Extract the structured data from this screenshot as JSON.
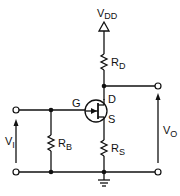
{
  "diagram": {
    "type": "circuit-schematic",
    "colors": {
      "ink": "#111111",
      "background": "#ffffff"
    },
    "labels": {
      "supply": {
        "main": "V",
        "sub": "DD"
      },
      "drain_resistor": {
        "main": "R",
        "sub": "D"
      },
      "bias_resistor": {
        "main": "R",
        "sub": "B"
      },
      "source_resistor": {
        "main": "R",
        "sub": "S"
      },
      "gate": "G",
      "drain": "D",
      "source": "S",
      "input_voltage": {
        "main": "V",
        "sub": "I"
      },
      "output_voltage": {
        "main": "V",
        "sub": "O"
      }
    },
    "components": [
      {
        "id": "VDD",
        "kind": "supply-arrow"
      },
      {
        "id": "RD",
        "kind": "resistor",
        "between": [
          "VDD",
          "drain"
        ]
      },
      {
        "id": "Q1",
        "kind": "n-channel-jfet",
        "pins": [
          "G",
          "D",
          "S"
        ]
      },
      {
        "id": "RS",
        "kind": "resistor",
        "between": [
          "source",
          "ground"
        ]
      },
      {
        "id": "RB",
        "kind": "resistor",
        "between": [
          "gate",
          "ground"
        ]
      },
      {
        "id": "GND",
        "kind": "ground"
      }
    ],
    "terminals": [
      {
        "id": "vi-top",
        "role": "input +"
      },
      {
        "id": "vi-bottom",
        "role": "input -"
      },
      {
        "id": "vo-top",
        "role": "output +"
      },
      {
        "id": "vo-bottom",
        "role": "output -"
      }
    ]
  }
}
